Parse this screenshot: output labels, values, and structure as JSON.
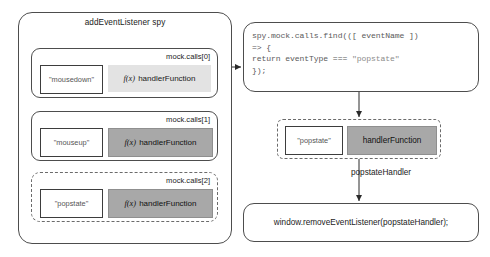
{
  "spy_panel": {
    "title": "addEventListener spy",
    "calls": [
      {
        "label": "mock.calls[0]",
        "event": "\"mousedown\"",
        "fx": "f(x)",
        "handler": "handlerFunction",
        "fill": "#e3e3e3",
        "dashed": false
      },
      {
        "label": "mock.calls[1]",
        "event": "\"mouseup\"",
        "fx": "f(x)",
        "handler": "handlerFunction",
        "fill": "#a8a8a8",
        "dashed": false
      },
      {
        "label": "mock.calls[2]",
        "event": "\"popstate\"",
        "fx": "f(x)",
        "handler": "handlerFunction",
        "fill": "#a8a8a8",
        "dashed": true
      }
    ]
  },
  "code_box": {
    "lines": [
      "spy.mock.calls.find(([ eventName ])",
      "=> {",
      "return eventType === \"popstate\"",
      "});"
    ],
    "line1": "spy.mock.calls.find(([ eventName ])",
    "line2": "=> {",
    "line3_a": "return eventType === ",
    "line3_b": "\"popstate\"",
    "line4": "});"
  },
  "result_box": {
    "event": "\"popstate\"",
    "handler": "handlerFunction",
    "fill": "#a8a8a8",
    "dashed": true
  },
  "edges": {
    "popstate_handler_label": "popstateHandler"
  },
  "remove_box": {
    "code": "window.removeEventListener(popstateHandler);"
  },
  "colors": {
    "stroke": "#4d4d4d",
    "dashed_stroke": "#6b6b6b",
    "handler_light": "#e3e3e3",
    "handler_dark": "#a8a8a8",
    "code_text": "#5a5a5a",
    "background": "#ffffff"
  }
}
